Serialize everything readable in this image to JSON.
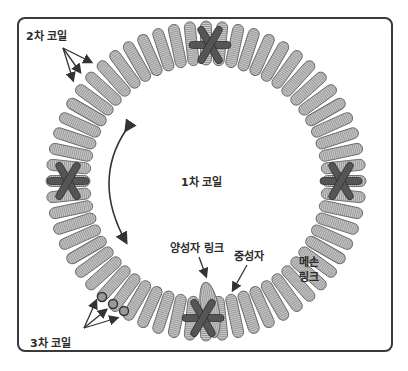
{
  "figure": {
    "type": "chromatin-coil-ring-diagram",
    "labels": {
      "secondary_coil": "2차 코일",
      "primary_coil": "1차 코일",
      "tertiary_coil": "3차 코일",
      "proton_link": "양성자 링크",
      "neutron": "중성자",
      "meson_link_line1": "메손",
      "meson_link_line2": "링크"
    },
    "ring": {
      "center": [
        206,
        181
      ],
      "outer_radius": 160,
      "inner_radius": 116,
      "coil_count": 60,
      "coil_color": "#b8b8b8",
      "coil_edge_color": "#6a6a6a"
    },
    "markers": [
      {
        "name": "top-star",
        "x": 210,
        "y": 45
      },
      {
        "name": "left-star",
        "x": 68,
        "y": 181
      },
      {
        "name": "right-star",
        "x": 341,
        "y": 181
      },
      {
        "name": "bottom-star",
        "x": 203,
        "y": 318
      }
    ],
    "marker_color": "#555555",
    "tertiary_circles": [
      {
        "x": 102,
        "y": 297
      },
      {
        "x": 113,
        "y": 304
      },
      {
        "x": 124,
        "y": 311
      }
    ]
  }
}
